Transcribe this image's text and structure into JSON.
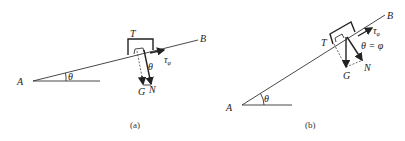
{
  "figure_a": {
    "caption": "(a)",
    "labels": {
      "A": "A",
      "B": "B",
      "T": "T",
      "G": "G",
      "N": "N",
      "theta_incline": "θ",
      "theta_force": "θ",
      "tau": "τ",
      "tau_sub": "φ"
    }
  },
  "figure_b": {
    "caption": "(b)",
    "labels": {
      "A": "A",
      "B": "B",
      "T": "T",
      "G": "G",
      "N": "N",
      "theta_incline": "θ",
      "theta_eq": "θ = φ",
      "tau": "τ",
      "tau_sub": "φ"
    }
  }
}
